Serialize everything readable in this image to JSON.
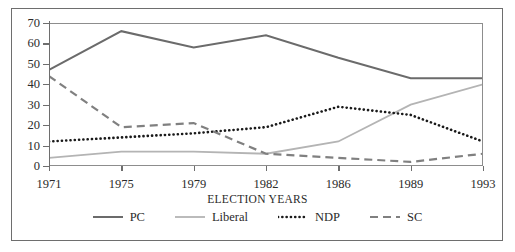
{
  "chart_data": {
    "type": "line",
    "title": "",
    "xlabel": "ELECTION YEARS",
    "ylabel": "",
    "categories": [
      "1971",
      "1975",
      "1979",
      "1982",
      "1986",
      "1989",
      "1993"
    ],
    "ylim": [
      0,
      70
    ],
    "yticks": [
      0,
      10,
      20,
      30,
      40,
      50,
      60,
      70
    ],
    "grid": false,
    "legend_position": "bottom",
    "series": [
      {
        "name": "PC",
        "values": [
          47,
          66,
          58,
          64,
          53,
          43,
          43
        ],
        "color": "#6b6b6b",
        "style": "solid",
        "width": 2.0
      },
      {
        "name": "Liberal",
        "values": [
          4,
          7,
          7,
          6,
          12,
          30,
          40
        ],
        "color": "#b4b4b4",
        "style": "solid",
        "width": 1.8
      },
      {
        "name": "NDP",
        "values": [
          12,
          14,
          16,
          19,
          29,
          25,
          12
        ],
        "color": "#1a1a1a",
        "style": "dotted",
        "width": 2.6
      },
      {
        "name": "SC",
        "values": [
          44,
          19,
          21,
          6,
          4,
          2,
          6
        ],
        "color": "#808080",
        "style": "dashed",
        "width": 2.2
      }
    ]
  },
  "axis": {
    "y_tick_labels": [
      "70",
      "60",
      "50",
      "40",
      "30",
      "20",
      "10",
      "0"
    ],
    "x_tick_labels": [
      "1971",
      "1975",
      "1979",
      "1982",
      "1986",
      "1989",
      "1993"
    ]
  },
  "legend": {
    "items": [
      {
        "label": "PC",
        "swatch": "solid-dark-line-swatch"
      },
      {
        "label": "Liberal",
        "swatch": "solid-light-line-swatch"
      },
      {
        "label": "NDP",
        "swatch": "dotted-line-swatch"
      },
      {
        "label": "SC",
        "swatch": "dashed-line-swatch"
      }
    ]
  },
  "x_axis_title": "ELECTION YEARS",
  "colors": {
    "frame": "#6e6e6e",
    "pc": "#6b6b6b",
    "liberal": "#b4b4b4",
    "ndp": "#1a1a1a",
    "sc": "#808080",
    "text": "#2b2b2b",
    "background": "#ffffff"
  }
}
